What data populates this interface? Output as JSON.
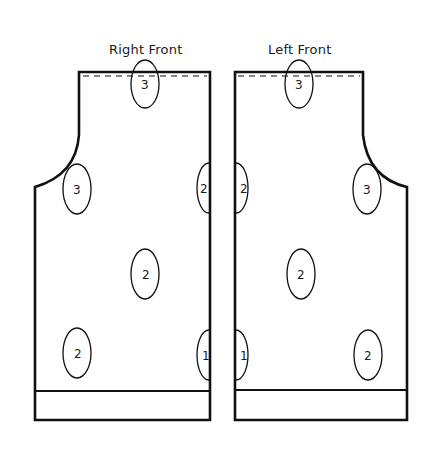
{
  "pieces": [
    {
      "name": "right-front",
      "title": "Right Front",
      "markers": [
        {
          "label": "3",
          "cx": 145,
          "cy": 84,
          "rx": 14,
          "ry": 24
        },
        {
          "label": "3",
          "cx": 77,
          "cy": 189,
          "rx": 14,
          "ry": 25
        },
        {
          "label": "2",
          "cx": 204,
          "cy": 188,
          "rx": 12,
          "ry": 25,
          "clip": "right"
        },
        {
          "label": "2",
          "cx": 145,
          "cy": 274,
          "rx": 14,
          "ry": 25
        },
        {
          "label": "2",
          "cx": 77,
          "cy": 353,
          "rx": 14,
          "ry": 25
        },
        {
          "label": "1",
          "cx": 206,
          "cy": 355,
          "rx": 12,
          "ry": 25,
          "clip": "right"
        }
      ]
    },
    {
      "name": "left-front",
      "title": "Left Front",
      "markers": [
        {
          "label": "3",
          "cx": 299,
          "cy": 84,
          "rx": 14,
          "ry": 24
        },
        {
          "label": "2",
          "cx": 238,
          "cy": 188,
          "rx": 12,
          "ry": 25,
          "clip": "left"
        },
        {
          "label": "3",
          "cx": 367,
          "cy": 189,
          "rx": 14,
          "ry": 25
        },
        {
          "label": "2",
          "cx": 301,
          "cy": 274,
          "rx": 14,
          "ry": 25
        },
        {
          "label": "1",
          "cx": 238,
          "cy": 355,
          "rx": 12,
          "ry": 25,
          "clip": "left"
        },
        {
          "label": "2",
          "cx": 368,
          "cy": 355,
          "rx": 14,
          "ry": 25
        }
      ]
    }
  ],
  "colors": {
    "line": "#111111",
    "background": "#ffffff"
  }
}
